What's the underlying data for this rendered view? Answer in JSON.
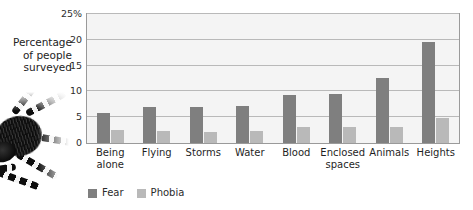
{
  "caption": {
    "axis_label_line1": "Percentage",
    "axis_label_line2": "of people",
    "axis_label_line3": "surveyed"
  },
  "illustration": {
    "name": "tarantula-spider-photo"
  },
  "colors": {
    "fear": "#7f7f7f",
    "phobia": "#b9b9b9",
    "plot_background": "#f4f4f4",
    "gridline": "#b9b9b9",
    "frame": "#9a9a9a"
  },
  "legend": {
    "position": "bottom-left",
    "items": [
      {
        "label": "Fear",
        "color": "#7f7f7f"
      },
      {
        "label": "Phobia",
        "color": "#b9b9b9"
      }
    ]
  },
  "chart_data": {
    "type": "bar",
    "title": "",
    "xlabel": "",
    "ylabel": "Percentage of people surveyed",
    "ylim": [
      0,
      25
    ],
    "yticks": [
      0,
      5,
      10,
      15,
      20,
      25
    ],
    "ytick_labels": [
      "0",
      "5",
      "10",
      "15",
      "20",
      "25%"
    ],
    "grid": true,
    "legend_position": "bottom-left",
    "categories": [
      "Being alone",
      "Flying",
      "Storms",
      "Water",
      "Blood",
      "Enclosed spaces",
      "Animals",
      "Heights"
    ],
    "category_lines": [
      [
        "Being",
        "alone"
      ],
      [
        "Flying"
      ],
      [
        "Storms"
      ],
      [
        "Water"
      ],
      [
        "Blood"
      ],
      [
        "Enclosed",
        "spaces"
      ],
      [
        "Animals"
      ],
      [
        "Heights"
      ]
    ],
    "series": [
      {
        "name": "Fear",
        "color": "#7f7f7f",
        "values": [
          5.8,
          6.9,
          7.0,
          7.1,
          9.4,
          9.5,
          12.6,
          19.5
        ]
      },
      {
        "name": "Phobia",
        "color": "#b9b9b9",
        "values": [
          2.5,
          2.4,
          2.1,
          2.3,
          3.1,
          3.2,
          3.2,
          4.9
        ]
      }
    ]
  }
}
